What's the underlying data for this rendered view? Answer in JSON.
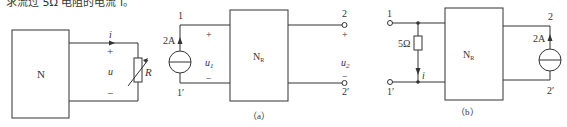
{
  "top_text": "求流过 5Ω 电阻的电流 i。",
  "figure_left": {
    "network_label": "N",
    "current_label": "i",
    "voltage_label": "u",
    "plus": "+",
    "minus": "−",
    "resistor_label": "R"
  },
  "figure_a": {
    "caption": "（a）",
    "network_label": "N",
    "network_subscript": "R",
    "source_value": "2A",
    "port1_top": "1",
    "port1_bottom": "1′",
    "port2_top": "2",
    "port2_bottom": "2′",
    "u1_label": "u",
    "u1_sub": "1",
    "u2_label": "u",
    "u2_sub": "2",
    "plus": "+",
    "minus": "−"
  },
  "figure_b": {
    "caption": "（b）",
    "network_label": "N",
    "network_subscript": "R",
    "resistor_value": "5Ω",
    "current_label": "i",
    "source_value": "2A",
    "port1_top": "1",
    "port1_bottom": "1′",
    "port2_top": "2",
    "port2_bottom": "2′"
  },
  "colors": {
    "line": "#333333",
    "background": "#ffffff"
  }
}
